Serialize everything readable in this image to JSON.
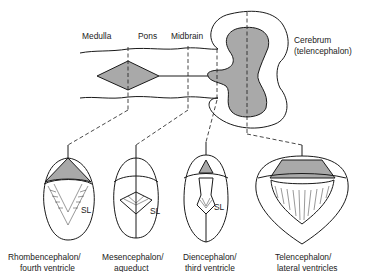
{
  "diagram": {
    "fill_color": "#a9a9a9",
    "top_labels": {
      "medulla": "Medulla",
      "pons": "Pons",
      "midbrain": "Midbrain",
      "cerebrum_line1": "Cerebrum",
      "cerebrum_line2": "(telencephalon)"
    },
    "sections": [
      {
        "line1": "Rhombencephalon/",
        "line2": "fourth ventricle",
        "marker": "SL"
      },
      {
        "line1": "Mesencephalon/",
        "line2": "aqueduct",
        "marker": "SL"
      },
      {
        "line1": "Diencephalon/",
        "line2": "third ventricle",
        "marker": "SL"
      },
      {
        "line1": "Telencephalon/",
        "line2": "lateral ventricles"
      }
    ]
  }
}
